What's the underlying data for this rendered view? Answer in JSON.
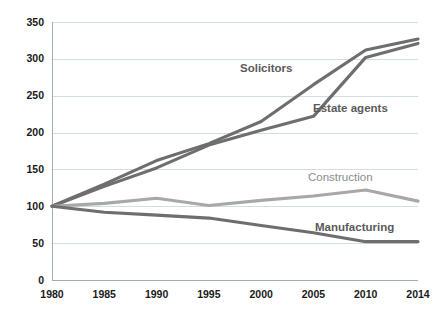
{
  "chart_data": {
    "type": "line",
    "title": "",
    "subtitle": "",
    "xlabel": "",
    "ylabel": "",
    "categories": [
      "1980",
      "1985",
      "1990",
      "1995",
      "2000",
      "2005",
      "2010",
      "2014"
    ],
    "ylim": [
      0,
      350
    ],
    "y_ticks": [
      "0",
      "50",
      "100",
      "150",
      "200",
      "250",
      "300",
      "350"
    ],
    "grid": true,
    "legend_position": "inline-labels",
    "series": [
      {
        "name": "Solicitors",
        "values": [
          100,
          130,
          162,
          185,
          215,
          265,
          312,
          327
        ],
        "color": "#6e6e6e",
        "label_bold": true
      },
      {
        "name": "Estate agents",
        "values": [
          100,
          127,
          152,
          183,
          203,
          222,
          302,
          321
        ],
        "color": "#6e6e6e",
        "label_bold": true
      },
      {
        "name": "Construction",
        "values": [
          100,
          104,
          111,
          101,
          108,
          114,
          122,
          107
        ],
        "color": "#a8a8a8",
        "label_bold": false
      },
      {
        "name": "Manufacturing",
        "values": [
          100,
          92,
          88,
          84,
          74,
          64,
          52,
          52
        ],
        "color": "#6e6e6e",
        "label_bold": true
      }
    ],
    "annotations": [
      {
        "text": "Solicitors",
        "x": 240,
        "y": 72,
        "color": "#5a5a5a",
        "bold": true
      },
      {
        "text": "Estate agents",
        "x": 313,
        "y": 112,
        "color": "#5a5a5a",
        "bold": true
      },
      {
        "text": "Construction",
        "x": 308,
        "y": 181,
        "color": "#8c8c8c",
        "bold": false
      },
      {
        "text": "Manufacturing",
        "x": 315,
        "y": 231,
        "color": "#5a5a5a",
        "bold": true
      }
    ],
    "colors": {
      "grid": "#c9d3dd",
      "axis": "#9aa5b1",
      "tick_text": "#1a1a1a",
      "background": "#ffffff"
    }
  }
}
